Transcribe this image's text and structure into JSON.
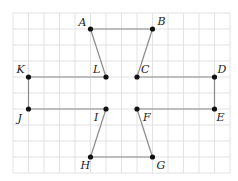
{
  "grid": {
    "origin_x": 13,
    "origin_y": 13,
    "cell_w": 15.5,
    "cell_h": 16,
    "cols": 14,
    "rows": 10,
    "line_color": "#e2e2e2"
  },
  "colors": {
    "segment": "#8a8a8a",
    "point": "#111111",
    "label": "#222222"
  },
  "points": [
    {
      "name": "A",
      "col": 5,
      "row": 1,
      "lx": -12,
      "ly": -3
    },
    {
      "name": "B",
      "col": 9,
      "row": 1,
      "lx": 5,
      "ly": -4
    },
    {
      "name": "C",
      "col": 8,
      "row": 4,
      "lx": 4,
      "ly": -4
    },
    {
      "name": "D",
      "col": 13,
      "row": 4,
      "lx": 3,
      "ly": -4
    },
    {
      "name": "E",
      "col": 13,
      "row": 6,
      "lx": 2,
      "ly": 12
    },
    {
      "name": "F",
      "col": 8,
      "row": 6,
      "lx": 6,
      "ly": 12
    },
    {
      "name": "G",
      "col": 9,
      "row": 9,
      "lx": 4,
      "ly": 12
    },
    {
      "name": "H",
      "col": 5,
      "row": 9,
      "lx": -10,
      "ly": 12
    },
    {
      "name": "I",
      "col": 6,
      "row": 6,
      "lx": -12,
      "ly": 12
    },
    {
      "name": "J",
      "col": 1,
      "row": 6,
      "lx": -11,
      "ly": 13
    },
    {
      "name": "K",
      "col": 1,
      "row": 4,
      "lx": -12,
      "ly": -4
    },
    {
      "name": "L",
      "col": 6,
      "row": 4,
      "lx": -13,
      "ly": -4
    }
  ],
  "segments": [
    [
      "A",
      "B"
    ],
    [
      "B",
      "C"
    ],
    [
      "C",
      "D"
    ],
    [
      "D",
      "E"
    ],
    [
      "E",
      "F"
    ],
    [
      "F",
      "G"
    ],
    [
      "G",
      "H"
    ],
    [
      "H",
      "I"
    ],
    [
      "I",
      "J"
    ],
    [
      "J",
      "K"
    ],
    [
      "K",
      "L"
    ],
    [
      "L",
      "A"
    ]
  ]
}
